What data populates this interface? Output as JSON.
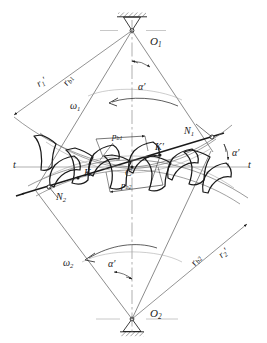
{
  "figure": {
    "type": "engineering-diagram",
    "background_color": "#ffffff",
    "line_color": "#1a1a1a",
    "thin_line_color": "#6e6e6e"
  },
  "labels": {
    "center_top": "O",
    "center_top_sub": "1",
    "center_bottom": "O",
    "center_bottom_sub": "2",
    "radius_pitch_1": "r",
    "radius_pitch_1_sub": "1",
    "radius_pitch_1_prime": "′",
    "radius_base_1": "r",
    "radius_base_1_sub": "b1",
    "radius_pitch_2": "r",
    "radius_pitch_2_sub": "2",
    "radius_pitch_2_prime": "′",
    "radius_base_2": "r",
    "radius_base_2_sub": "b2",
    "omega_1": "ω",
    "omega_1_sub": "1",
    "omega_2": "ω",
    "omega_2_sub": "2",
    "alpha_top": "α′",
    "alpha_right": "α′",
    "alpha_bottom": "α′",
    "pitch_base_1": "p",
    "pitch_base_1_sub": "b1",
    "pitch_base_2": "p",
    "pitch_base_2_sub": "b2",
    "point_n1": "N",
    "point_n1_sub": "1",
    "point_n2": "N",
    "point_n2_sub": "2",
    "point_k": "K",
    "point_k_prime": "K′",
    "point_c": "C",
    "tangent_left": "t",
    "tangent_right": "t"
  }
}
